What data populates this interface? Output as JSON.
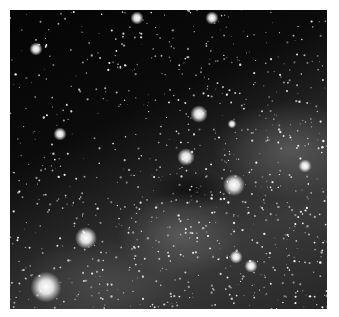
{
  "image": {
    "subject": "Milky Way starfield",
    "frame": {
      "x": 10,
      "y": 10,
      "width": 317,
      "height": 299
    },
    "border_color": "#ffffff",
    "bright_stars": [
      {
        "x": 127,
        "y": 8,
        "r": 3
      },
      {
        "x": 202,
        "y": 8,
        "r": 3
      },
      {
        "x": 26,
        "y": 39,
        "r": 3
      },
      {
        "x": 189,
        "y": 104,
        "r": 4
      },
      {
        "x": 50,
        "y": 124,
        "r": 3
      },
      {
        "x": 176,
        "y": 147,
        "r": 4
      },
      {
        "x": 224,
        "y": 175,
        "r": 5
      },
      {
        "x": 76,
        "y": 228,
        "r": 5
      },
      {
        "x": 36,
        "y": 277,
        "r": 7
      },
      {
        "x": 226,
        "y": 247,
        "r": 3
      },
      {
        "x": 241,
        "y": 256,
        "r": 3
      },
      {
        "x": 222,
        "y": 114,
        "r": 2
      },
      {
        "x": 295,
        "y": 156,
        "r": 3
      }
    ]
  }
}
